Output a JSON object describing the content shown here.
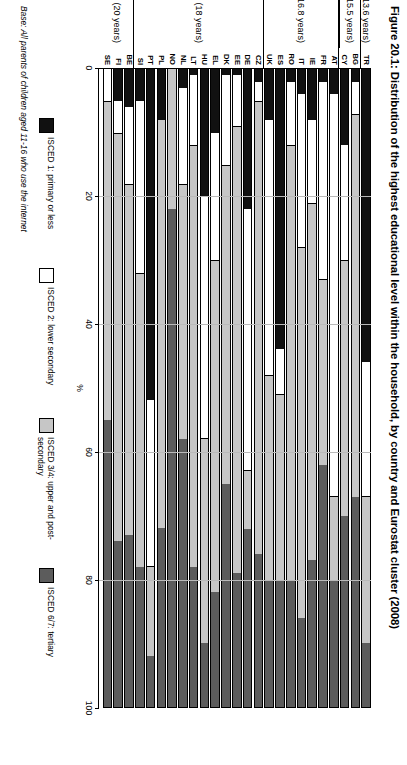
{
  "figure": {
    "title": "Figure 20.1: Distribution of the highest educational level within the household, by country and Eurostat cluster (2008)",
    "base_note": "Base: All parents of children aged 11-16 who use the internet"
  },
  "legend": {
    "items": [
      {
        "label": "ISCED 1: primary or less",
        "color": "#111111"
      },
      {
        "label": "ISCED 2: lower secondary",
        "color": "#ffffff"
      },
      {
        "label": "ISCED 3/4: upper and post-secondary",
        "color": "#c6c6c6"
      },
      {
        "label": "ISCED 6/7: tertiary",
        "color": "#5c5c5c"
      }
    ]
  },
  "clusters": [
    {
      "label": "Cluster 1 (13.6 years)",
      "countries": [
        "TR"
      ]
    },
    {
      "label": "Cluster 2 (15.5 years)",
      "countries": [
        "BG",
        "CY"
      ]
    },
    {
      "label": "Cluster 3 (16.8 years)",
      "countries": [
        "AT",
        "FR",
        "IE",
        "IT",
        "RO",
        "ES",
        "UK"
      ]
    },
    {
      "label": "Cluster 4 (18 years)",
      "countries": [
        "CZ",
        "DE",
        "EE",
        "DK",
        "EL",
        "HU",
        "LT",
        "NL",
        "NO",
        "PL",
        "PT",
        "SI"
      ]
    },
    {
      "label": "Cluster 5 (20 years)",
      "countries": [
        "BE",
        "FI",
        "SE"
      ]
    }
  ],
  "chart_data": {
    "type": "bar",
    "orientation": "horizontal-stacked",
    "title": "Figure 20.1: Distribution of the highest educational level within the household, by country and Eurostat cluster (2008)",
    "xlabel": "%",
    "ylabel": "",
    "xlim": [
      0,
      100
    ],
    "xticks": [
      0,
      20,
      40,
      60,
      80,
      100
    ],
    "grid": false,
    "legend_position": "right",
    "categories": [
      "TR",
      "BG",
      "CY",
      "AT",
      "FR",
      "IE",
      "IT",
      "RO",
      "ES",
      "UK",
      "CZ",
      "DE",
      "EE",
      "DK",
      "EL",
      "HU",
      "LT",
      "NL",
      "NO",
      "PL",
      "PT",
      "SI",
      "BE",
      "FI",
      "SE"
    ],
    "series": [
      {
        "name": "ISCED 1: primary or less",
        "color": "#111111",
        "values": [
          46,
          2,
          12,
          4,
          2,
          8,
          4,
          2,
          44,
          8,
          2,
          22,
          1,
          1,
          10,
          20,
          1,
          3,
          0,
          8,
          52,
          5,
          6,
          5,
          0
        ]
      },
      {
        "name": "ISCED 2: lower secondary",
        "color": "#ffffff",
        "values": [
          21,
          5,
          18,
          63,
          31,
          13,
          24,
          10,
          7,
          40,
          3,
          41,
          8,
          14,
          20,
          38,
          11,
          15,
          0,
          0,
          26,
          27,
          12,
          5,
          5
        ]
      },
      {
        "name": "ISCED 3/4: upper and post-secondary",
        "color": "#c6c6c6",
        "values": [
          23,
          60,
          40,
          13,
          29,
          56,
          58,
          68,
          29,
          32,
          71,
          9,
          70,
          50,
          52,
          32,
          66,
          40,
          22,
          64,
          14,
          46,
          55,
          64,
          50
        ]
      },
      {
        "name": "ISCED 6/7: tertiary",
        "color": "#5c5c5c",
        "values": [
          10,
          33,
          30,
          20,
          38,
          23,
          14,
          20,
          20,
          20,
          24,
          28,
          21,
          35,
          18,
          10,
          22,
          42,
          78,
          28,
          8,
          22,
          27,
          26,
          45
        ]
      }
    ]
  }
}
